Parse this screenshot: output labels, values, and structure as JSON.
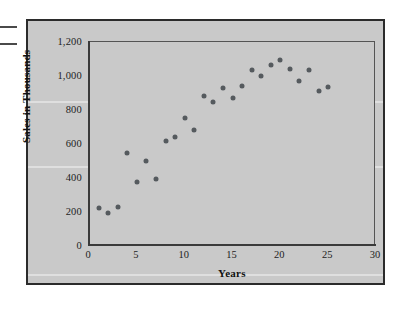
{
  "figure": {
    "background_color": "#c9c9c9",
    "border_color": "#2b2b2b",
    "point_color": "#555a5e"
  },
  "chart_data": {
    "type": "scatter",
    "title": "",
    "subtitle": "",
    "xlabel": "Years",
    "ylabel": "Sales in Thousands",
    "xlim": [
      0,
      30
    ],
    "ylim": [
      0,
      1200
    ],
    "grid": false,
    "legend": null,
    "xticks": [
      "0",
      "5",
      "10",
      "15",
      "20",
      "25",
      "30"
    ],
    "xtick_values": [
      0,
      5,
      10,
      15,
      20,
      25,
      30
    ],
    "yticks": [
      "0",
      "200",
      "400",
      "600",
      "800",
      "1,000",
      "1,200"
    ],
    "ytick_values": [
      0,
      200,
      400,
      600,
      800,
      1000,
      1200
    ],
    "x": [
      1,
      2,
      3,
      4,
      5,
      6,
      7,
      8,
      9,
      10,
      11,
      12,
      13,
      14,
      15,
      16,
      17,
      18,
      19,
      20,
      21,
      22,
      23,
      24,
      25
    ],
    "y": [
      222,
      192,
      232,
      548,
      378,
      500,
      395,
      620,
      640,
      752,
      682,
      882,
      845,
      932,
      872,
      940,
      1035,
      1000,
      1062,
      1095,
      1040,
      972,
      1038,
      910,
      938
    ],
    "points": [
      {
        "x": 1,
        "y": 222
      },
      {
        "x": 2,
        "y": 192
      },
      {
        "x": 3,
        "y": 232
      },
      {
        "x": 4,
        "y": 548
      },
      {
        "x": 5,
        "y": 378
      },
      {
        "x": 6,
        "y": 500
      },
      {
        "x": 7,
        "y": 395
      },
      {
        "x": 8,
        "y": 620
      },
      {
        "x": 9,
        "y": 640
      },
      {
        "x": 10,
        "y": 752
      },
      {
        "x": 11,
        "y": 682
      },
      {
        "x": 12,
        "y": 882
      },
      {
        "x": 13,
        "y": 845
      },
      {
        "x": 14,
        "y": 932
      },
      {
        "x": 15,
        "y": 872
      },
      {
        "x": 16,
        "y": 940
      },
      {
        "x": 17,
        "y": 1035
      },
      {
        "x": 18,
        "y": 1000
      },
      {
        "x": 19,
        "y": 1062
      },
      {
        "x": 20,
        "y": 1095
      },
      {
        "x": 21,
        "y": 1040
      },
      {
        "x": 22,
        "y": 972
      },
      {
        "x": 23,
        "y": 1038
      },
      {
        "x": 24,
        "y": 910
      },
      {
        "x": 25,
        "y": 938
      }
    ]
  }
}
